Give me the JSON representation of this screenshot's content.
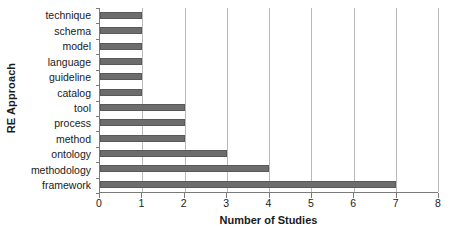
{
  "chart_data": {
    "type": "bar",
    "orientation": "horizontal",
    "title": "",
    "xlabel": "Number of Studies",
    "ylabel": "RE Approach",
    "categories": [
      "technique",
      "schema",
      "model",
      "language",
      "guideline",
      "catalog",
      "tool",
      "process",
      "method",
      "ontology",
      "methodology",
      "framework"
    ],
    "values": [
      1,
      1,
      1,
      1,
      1,
      1,
      2,
      2,
      2,
      3,
      4,
      7
    ],
    "xlim": [
      0,
      8
    ],
    "xticks": [
      0,
      1,
      2,
      3,
      4,
      5,
      6,
      7,
      8
    ],
    "xticklabels": [
      "0",
      "1",
      "2",
      "3",
      "4",
      "5",
      "6",
      "7",
      "8"
    ],
    "grid": "vertical",
    "legend": "none",
    "colors": {
      "bar_fill": "#6d6d6d",
      "bar_edge": "#595959",
      "gridline": "#b9b9b9",
      "axis": "#7a7a7a",
      "text": "#1a1a1a",
      "background": "#ffffff"
    }
  }
}
